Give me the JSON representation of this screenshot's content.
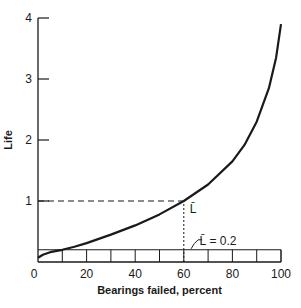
{
  "chart_data": {
    "type": "line",
    "title": "",
    "xlabel": "Bearings failed, percent",
    "ylabel": "Life",
    "xlim": [
      0,
      100
    ],
    "ylim": [
      0,
      4
    ],
    "x_ticks": [
      0,
      20,
      40,
      60,
      80,
      100
    ],
    "x_tick_labels": [
      "0",
      "20",
      "40",
      "60",
      "80",
      "100"
    ],
    "x_minor_ticks": [
      10,
      20,
      30,
      40,
      50,
      60,
      70,
      80,
      90,
      100
    ],
    "y_ticks": [
      1,
      2,
      3,
      4
    ],
    "y_tick_labels": [
      "1",
      "2",
      "3",
      "4"
    ],
    "y_origin_label": "0",
    "grid": false,
    "series": [
      {
        "name": "Life curve",
        "x": [
          0,
          2,
          5,
          10,
          15,
          20,
          30,
          40,
          50,
          60,
          70,
          80,
          85,
          90,
          95,
          98,
          100
        ],
        "y": [
          0.07,
          0.12,
          0.16,
          0.2,
          0.25,
          0.31,
          0.45,
          0.6,
          0.78,
          1.0,
          1.27,
          1.65,
          1.92,
          2.3,
          2.85,
          3.35,
          3.9
        ]
      }
    ],
    "reference_lines": [
      {
        "name": "L10 horizontal",
        "axis": "y",
        "value": 0.2,
        "x_range": [
          0,
          100
        ],
        "style": "solid"
      },
      {
        "name": "mean life horizontal",
        "axis": "y",
        "value": 1.0,
        "x_range": [
          0,
          60
        ],
        "style": "dashed"
      },
      {
        "name": "mean life vertical",
        "axis": "x",
        "value": 60,
        "y_range": [
          0,
          1.0
        ],
        "style": "dashed"
      }
    ],
    "annotations": [
      {
        "text": "L̄",
        "x": 62,
        "y": 0.9
      },
      {
        "text": "L̄ = 0.2",
        "x": 70,
        "y": 0.3
      }
    ]
  }
}
